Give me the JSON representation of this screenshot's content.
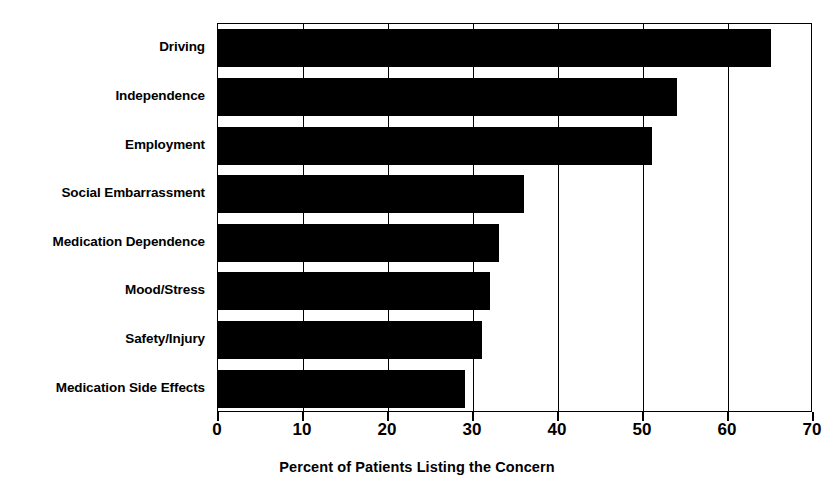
{
  "chart_data": {
    "type": "bar",
    "orientation": "horizontal",
    "title": "",
    "xlabel": "Percent of Patients Listing the Concern",
    "ylabel": "",
    "xlim": [
      0,
      70
    ],
    "xticks": [
      0,
      10,
      20,
      30,
      40,
      50,
      60,
      70
    ],
    "xtick_labels": [
      "0",
      "10",
      "20",
      "30",
      "40",
      "50",
      "60",
      "70"
    ],
    "grid": "vertical",
    "legend": "none",
    "bar_color": "#000000",
    "background_color": "#FFFFFF",
    "categories": [
      "Driving",
      "Independence",
      "Employment",
      "Social Embarrassment",
      "Medication Dependence",
      "Mood/Stress",
      "Safety/Injury",
      "Medication Side Effects"
    ],
    "values": [
      65,
      54,
      51,
      36,
      33,
      32,
      31,
      29
    ]
  }
}
